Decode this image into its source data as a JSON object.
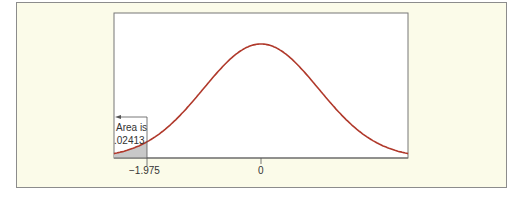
{
  "chart_data": {
    "type": "area",
    "title": "",
    "xlabel": "",
    "ylabel": "",
    "distribution": "standard normal",
    "mean": 0,
    "x_range": [
      -2.55,
      2.55
    ],
    "tick_labels": [
      "−1.975",
      "0"
    ],
    "ticks": [
      -1.975,
      0
    ],
    "shaded_region": {
      "from": "-inf",
      "to": -1.975,
      "area": 0.02413
    },
    "annotation": {
      "line1": "Area is",
      "line2": ".02413",
      "arrow": "left"
    },
    "grid": false,
    "legend": null
  },
  "colors": {
    "background": "#fbfbe9",
    "plot_background": "#ffffff",
    "curve": "#b0392b",
    "shade": "#c8c8c8",
    "axis": "#666666",
    "frame_border": "#8c8c8c"
  },
  "labels": {
    "area_line1": "Area is",
    "area_line2": ".02413",
    "tick_neg": "−1.975",
    "tick_zero": "0"
  }
}
